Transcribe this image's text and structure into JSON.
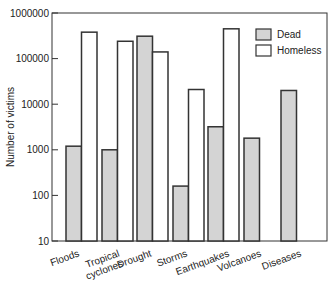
{
  "chart_data": {
    "type": "bar",
    "title": "",
    "xlabel": "",
    "ylabel": "Number of victims",
    "yscale": "log",
    "ylim": [
      10,
      1000000
    ],
    "yticks": [
      10,
      100,
      1000,
      10000,
      100000,
      1000000
    ],
    "ytick_labels": [
      "10",
      "100",
      "1000",
      "10000",
      "100000",
      "1000000"
    ],
    "grid": false,
    "legend_position": "upper right",
    "categories": [
      "Floods",
      "Tropical cyclones",
      "Drought",
      "Storms",
      "Earthquakes",
      "Volcanoes",
      "Diseases"
    ],
    "category_labels": [
      [
        "Floods"
      ],
      [
        "Tropical",
        "cyclones"
      ],
      [
        "Drought"
      ],
      [
        "Storms"
      ],
      [
        "Earthquakes"
      ],
      [
        "Volcanoes"
      ],
      [
        "Diseases"
      ]
    ],
    "series": [
      {
        "name": "Dead",
        "color": "#d4d4d4",
        "values": [
          1200,
          1000,
          310000,
          160,
          3200,
          1800,
          20000
        ]
      },
      {
        "name": "Homeless",
        "color": "#ffffff",
        "values": [
          380000,
          240000,
          140000,
          21000,
          450000,
          null,
          null
        ]
      }
    ]
  },
  "colors": {
    "axis": "#333333",
    "bar_edge": "#333333"
  }
}
